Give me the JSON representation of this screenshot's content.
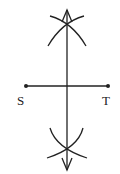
{
  "diagram": {
    "type": "perpendicular-bisector-construction",
    "segment": {
      "start_label": "S",
      "end_label": "T"
    },
    "stroke_color": "#222222",
    "background": "#ffffff"
  }
}
